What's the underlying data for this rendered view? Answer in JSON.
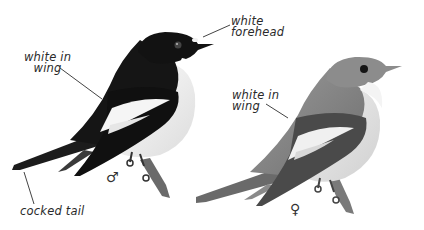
{
  "figure": {
    "male": {
      "symbol": "♂",
      "annotations": {
        "forehead": "white\nforehead",
        "wing": "white in\nwing",
        "tail": "cocked tail"
      }
    },
    "female": {
      "symbol": "♀",
      "annotations": {
        "wing": "white in\nwing"
      }
    },
    "colors": {
      "background": "#ffffff",
      "male_upperparts": "#151515",
      "male_underparts": "#f4f4f4",
      "female_upperparts": "#8a8a8a",
      "female_underparts": "#e8e8e8",
      "label_text": "#2a2a2a",
      "leader_line": "#444444"
    }
  }
}
